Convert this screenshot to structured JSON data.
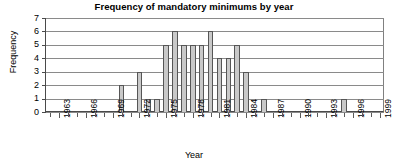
{
  "chart_data": {
    "type": "bar",
    "title": "Frequency of mandatory minimums by year",
    "xlabel": "Year",
    "ylabel": "Frequency",
    "ylim": [
      0,
      7
    ],
    "yticks": [
      0,
      1,
      2,
      3,
      4,
      5,
      6,
      7
    ],
    "grid": true,
    "legend": null,
    "xlim": [
      1962,
      2000
    ],
    "xtick_labels": [
      "1963",
      "1966",
      "1969",
      "1972",
      "1975",
      "1978",
      "1981",
      "1984",
      "1987",
      "1990",
      "1993",
      "1996",
      "1999"
    ],
    "xtick_years": [
      1963,
      1966,
      1969,
      1972,
      1975,
      1978,
      1981,
      1984,
      1987,
      1990,
      1993,
      1996,
      1999
    ],
    "categories": [
      1962,
      1963,
      1964,
      1965,
      1966,
      1967,
      1968,
      1969,
      1970,
      1971,
      1972,
      1973,
      1974,
      1975,
      1976,
      1977,
      1978,
      1979,
      1980,
      1981,
      1982,
      1983,
      1984,
      1985,
      1986,
      1987,
      1988,
      1989,
      1990,
      1991,
      1992,
      1993,
      1994,
      1995,
      1996,
      1997,
      1998,
      1999
    ],
    "values": [
      0,
      0,
      0,
      0,
      0,
      0,
      0,
      0,
      2,
      0,
      3,
      1,
      1,
      5,
      6,
      5,
      5,
      5,
      6,
      4,
      4,
      5,
      3,
      0,
      1,
      0,
      0,
      0,
      0,
      0,
      0,
      0,
      0,
      1,
      0,
      0,
      0,
      0
    ]
  },
  "colors": {
    "bar_fill": "#c9c9c9",
    "bar_stroke": "#565656",
    "gridline": "#8a8a8a",
    "axis": "#4a4a4a",
    "text": "#000000",
    "background": "#ffffff"
  }
}
